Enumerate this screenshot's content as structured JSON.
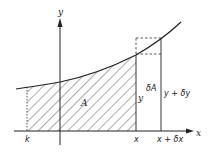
{
  "diagram": {
    "title": "",
    "axes": {
      "x_label": "x",
      "y_label": "y"
    },
    "labels": {
      "area": "A",
      "height_y": "y",
      "delta_area": "δA",
      "height_y_plus": "y + δy",
      "lower_limit": "k",
      "x_tick": "x",
      "x_plus_tick": "x + δx"
    },
    "colors": {
      "line": "#222222",
      "background": "#ffffff"
    }
  }
}
